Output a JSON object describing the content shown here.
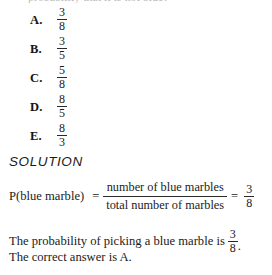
{
  "page": {
    "cut_off_top_line": "probability that it is not blue?",
    "background_color": "#ffffff",
    "text_color": "#1b1b1b"
  },
  "choices": [
    {
      "letter": "A.",
      "numerator": "3",
      "denominator": "8"
    },
    {
      "letter": "B.",
      "numerator": "3",
      "denominator": "5"
    },
    {
      "letter": "C.",
      "numerator": "5",
      "denominator": "8"
    },
    {
      "letter": "D.",
      "numerator": "8",
      "denominator": "5"
    },
    {
      "letter": "E.",
      "numerator": "8",
      "denominator": "3"
    }
  ],
  "solution": {
    "heading": "SOLUTION",
    "formula": {
      "lhs": "P(blue marble)",
      "equals": "=",
      "numerator": "number of blue marbles",
      "denominator": "total number of marbles",
      "equals2": "=",
      "result_numerator": "3",
      "result_denominator": "8"
    },
    "conclusion_1": {
      "text": "The probability of picking a blue marble is",
      "numerator": "3",
      "denominator": "8",
      "period": "."
    },
    "conclusion_2": "The correct answer is A."
  }
}
